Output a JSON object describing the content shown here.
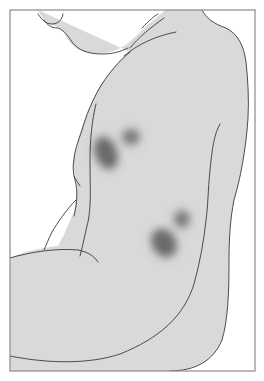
{
  "figure": {
    "description": "Line illustration of a seated person's torso and arm seen from the side, with four dark blurred lesions on the upper arm",
    "colors": {
      "background": "#ffffff",
      "skin_fill": "#d9d9d9",
      "outline": "#3a3a3a",
      "frame": "#8a8a8a",
      "lesion": "#555555"
    },
    "lesions": [
      {
        "id": "upper-left-large",
        "cx": 106,
        "cy": 153,
        "rx": 11,
        "ry": 17,
        "rotate": -20,
        "opacity": 0.85
      },
      {
        "id": "upper-right-small",
        "cx": 131,
        "cy": 137,
        "rx": 9,
        "ry": 8,
        "rotate": 0,
        "opacity": 0.75
      },
      {
        "id": "lower-right-small",
        "cx": 182,
        "cy": 219,
        "rx": 8,
        "ry": 9,
        "rotate": 0,
        "opacity": 0.75
      },
      {
        "id": "lower-left-large",
        "cx": 164,
        "cy": 243,
        "rx": 12,
        "ry": 15,
        "rotate": -30,
        "opacity": 0.85
      }
    ]
  }
}
